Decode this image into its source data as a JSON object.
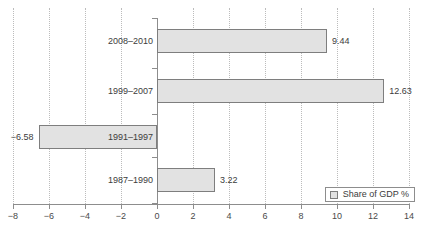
{
  "chart_data": {
    "type": "bar",
    "orientation": "horizontal",
    "title": "",
    "xlabel": "",
    "ylabel": "",
    "xlim": [
      -8,
      14
    ],
    "grid": true,
    "legend_position": "bottom-right",
    "categories": [
      "2008–2010",
      "1999–2007",
      "1991–1997",
      "1987–1990"
    ],
    "values": [
      9.44,
      12.63,
      -6.58,
      3.22
    ],
    "value_labels": [
      "9.44",
      "12.63",
      "−6.58",
      "3.22"
    ],
    "xticks": [
      -8,
      -6,
      -4,
      -2,
      0,
      2,
      4,
      6,
      8,
      10,
      12,
      14
    ],
    "xtick_labels": [
      "−8",
      "−6",
      "−4",
      "−2",
      "0",
      "2",
      "4",
      "6",
      "8",
      "10",
      "12",
      "14"
    ],
    "series": [
      {
        "name": "Share of GDP %",
        "values": [
          9.44,
          12.63,
          -6.58,
          3.22
        ]
      }
    ],
    "colors": {
      "bar_fill": "#e2e2e2",
      "bar_border": "#7e7e7e",
      "axis": "#8d8d8d",
      "grid": "#bcbcbc",
      "text": "#3c3c3c",
      "background": "#ffffff"
    }
  },
  "legend": {
    "entries": [
      {
        "label": "Share of GDP %",
        "swatch": "#e2e2e2"
      }
    ]
  }
}
